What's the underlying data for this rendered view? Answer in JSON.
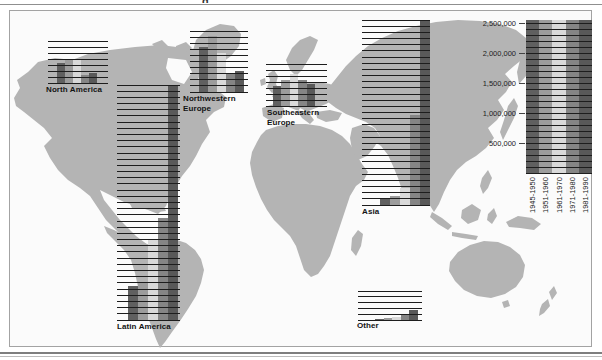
{
  "page": {
    "title_fragment": "g"
  },
  "colors": {
    "land": "#b4b4b4",
    "ocean": "#fbfbfb",
    "frame_border": "#a3a3a3",
    "gridline": "#1d1d1d",
    "periods": [
      "#606060",
      "#9c9c9c",
      "#d9d9d9",
      "#858585",
      "#595959"
    ]
  },
  "periods": [
    "1945-1950",
    "1951-1960",
    "1961-1970",
    "1971-1980",
    "1981-1990"
  ],
  "legend": {
    "ticks": [
      "2,500,000",
      "2,000,000",
      "1,500,000",
      "1,000,000",
      "500,000"
    ],
    "tick_values": [
      2500000,
      2000000,
      1500000,
      1000000,
      500000
    ],
    "col_labels": [
      "1945-1950",
      "1951-1960",
      "1961-1970",
      "1971-1980",
      "1981-1990"
    ]
  },
  "chart_data": [
    {
      "type": "bar",
      "region": "North America",
      "label_lines": [
        "North America"
      ],
      "categories": [
        "1945-1950",
        "1951-1960",
        "1961-1970",
        "1971-1980",
        "1981-1990"
      ],
      "values": [
        340000,
        380000,
        390000,
        140000,
        170000
      ],
      "ylim": [
        0,
        700000
      ],
      "gridline_interval": 100000,
      "grid": true,
      "legend_position": "right"
    },
    {
      "type": "bar",
      "region": "Latin America",
      "label_lines": [
        "Latin America"
      ],
      "categories": [
        "1945-1950",
        "1951-1960",
        "1961-1970",
        "1971-1980",
        "1981-1990"
      ],
      "values": [
        550000,
        620000,
        1300000,
        1650000,
        3800000
      ],
      "ylim": [
        0,
        3800000
      ],
      "gridline_interval": 100000,
      "grid": true
    },
    {
      "type": "bar",
      "region": "Northwestern Europe",
      "label_lines": [
        "Northwestern",
        "Europe"
      ],
      "categories": [
        "1945-1950",
        "1951-1960",
        "1961-1970",
        "1971-1980",
        "1981-1990"
      ],
      "values": [
        730000,
        920000,
        640000,
        290000,
        340000
      ],
      "ylim": [
        0,
        1000000
      ],
      "gridline_interval": 100000,
      "grid": true
    },
    {
      "type": "bar",
      "region": "Southeastern Europe",
      "label_lines": [
        "Southeastern",
        "Europe"
      ],
      "categories": [
        "1945-1950",
        "1951-1960",
        "1961-1970",
        "1971-1980",
        "1981-1990"
      ],
      "values": [
        330000,
        440000,
        530000,
        440000,
        370000
      ],
      "ylim": [
        0,
        700000
      ],
      "gridline_interval": 100000,
      "grid": true
    },
    {
      "type": "bar",
      "region": "Asia",
      "label_lines": [
        "Asia"
      ],
      "categories": [
        "1945-1950",
        "1951-1960",
        "1961-1970",
        "1971-1980",
        "1981-1990"
      ],
      "values": [
        120000,
        140000,
        280000,
        1460000,
        3000000
      ],
      "ylim": [
        0,
        3000000
      ],
      "gridline_interval": 100000,
      "grid": true
    },
    {
      "type": "bar",
      "region": "Other",
      "label_lines": [
        "Other"
      ],
      "categories": [
        "1945-1950",
        "1951-1960",
        "1961-1970",
        "1971-1980",
        "1981-1990"
      ],
      "values": [
        15000,
        30000,
        55000,
        110000,
        180000
      ],
      "ylim": [
        0,
        500000
      ],
      "gridline_interval": 100000,
      "grid": true
    }
  ]
}
